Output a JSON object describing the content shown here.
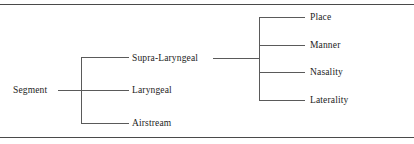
{
  "figure": {
    "type": "tree-diagram",
    "title": "",
    "root": {
      "label": "Segment",
      "children": [
        {
          "label": "Supra-Laryngeal",
          "children": [
            {
              "label": "Place"
            },
            {
              "label": "Manner"
            },
            {
              "label": "Nasality"
            },
            {
              "label": "Laterality"
            }
          ]
        },
        {
          "label": "Laryngeal",
          "children": []
        },
        {
          "label": "Airstream",
          "children": []
        }
      ]
    },
    "nodes": {
      "root": "Segment",
      "level1": [
        "Supra-Laryngeal",
        "Laryngeal",
        "Airstream"
      ],
      "level2": [
        "Place",
        "Manner",
        "Nasality",
        "Laterality"
      ]
    },
    "colors": {
      "line": "#5a5a5a",
      "rule": "#4a4a4a",
      "text": "#1c1c1c",
      "background": "#ffffff"
    }
  }
}
